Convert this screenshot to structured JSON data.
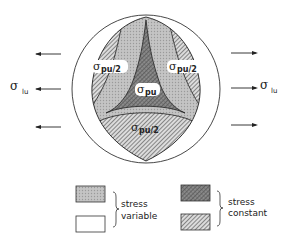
{
  "figure": {
    "labels": {
      "sigma": "σ",
      "pu_half_sub": "pu/2",
      "pu_sub": "pu",
      "lu_sub": "lu"
    },
    "regions": [
      {
        "id": "left-lobe",
        "label": "σpu/2",
        "fill": "hatched"
      },
      {
        "id": "right-lobe",
        "label": "σpu/2",
        "fill": "hatched"
      },
      {
        "id": "bottom-lobe",
        "label": "σpu/2",
        "fill": "hatched"
      },
      {
        "id": "center",
        "label": "σpu",
        "fill": "crosshatched"
      },
      {
        "id": "bands",
        "label": "",
        "fill": "dotted"
      },
      {
        "id": "outer-ring",
        "label": "",
        "fill": "white"
      }
    ],
    "load_left": {
      "label": "σlu",
      "direction": "left",
      "arrow_count": 3
    },
    "load_right": {
      "label": "σlu",
      "direction": "right",
      "arrow_count": 3
    }
  },
  "legend": {
    "group_variable": {
      "line1": "stress",
      "line2": "variable",
      "swatches": [
        "dotted",
        "white"
      ]
    },
    "group_constant": {
      "line1": "stress",
      "line2": "constant",
      "swatches": [
        "crosshatched",
        "hatched"
      ]
    }
  },
  "colors": {
    "ink": "#222222",
    "dotted": "#b8b8b8",
    "hatched_bg": "#d6d6d6",
    "cross_bg": "#8a8a8a"
  }
}
